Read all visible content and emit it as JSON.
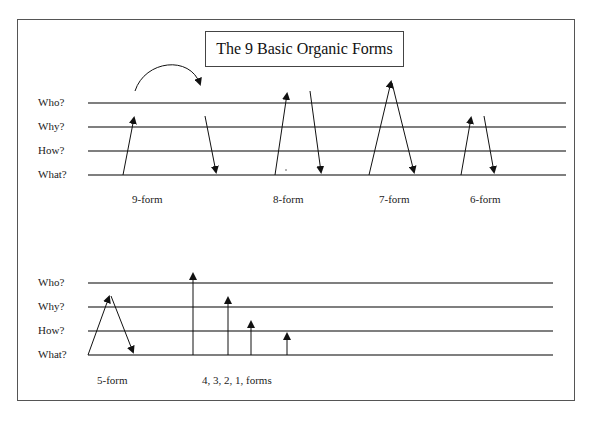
{
  "title": "The 9 Basic Organic Forms",
  "upper_panel": {
    "axis_labels": [
      "Who?",
      "Why?",
      "How?",
      "What?"
    ],
    "form_labels": [
      "9-form",
      "8-form",
      "7-form",
      "6-form"
    ]
  },
  "lower_panel": {
    "axis_labels": [
      "Who?",
      "Why?",
      "How?",
      "What?"
    ],
    "form_labels": [
      "5-form",
      "4, 3, 2, 1, forms"
    ]
  },
  "colors": {
    "line": "#555555",
    "arrow": "#111111",
    "frame": "#555555"
  }
}
